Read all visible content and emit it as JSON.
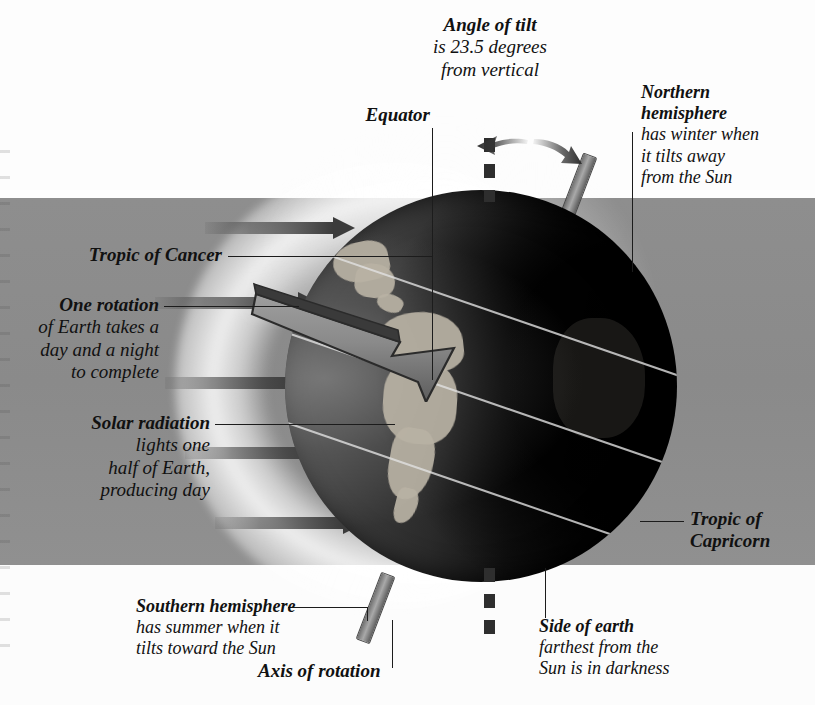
{
  "diagram": {
    "subject": "Earth",
    "tilt_degrees": "23.5"
  },
  "labels": {
    "angle_of_tilt": {
      "head": "Angle of tilt",
      "line2": "is 23.5 degrees",
      "line3": "from vertical"
    },
    "equator": {
      "head": "Equator"
    },
    "northern_hemisphere": {
      "head": "Northern",
      "head2": "hemisphere",
      "line3": "has winter when",
      "line4": "it tilts away",
      "line5": "from the Sun"
    },
    "tropic_of_cancer": {
      "head": "Tropic of Cancer"
    },
    "one_rotation": {
      "head": "One rotation",
      "line2": "of Earth takes a",
      "line3": "day and a night",
      "line4": "to complete"
    },
    "solar_radiation": {
      "head": "Solar radiation",
      "line2": "lights one",
      "line3": "half of Earth,",
      "line4": "producing day"
    },
    "tropic_of_capricorn": {
      "head": "Tropic of",
      "head2": "Capricorn"
    },
    "southern_hemisphere": {
      "head": "Southern hemisphere",
      "line2": "has summer when it",
      "line3": "tilts toward the Sun"
    },
    "axis_of_rotation": {
      "head": "Axis of rotation"
    },
    "side_of_earth": {
      "head": "Side of earth",
      "line2": "farthest from the",
      "line3": "Sun is in darkness"
    }
  },
  "colors": {
    "background_band": "#8e8e8e",
    "page_white": "#ffffff",
    "text": "#111111",
    "arrow_dark": "#3b3b3b",
    "axis_rod": "#a9a9a9",
    "land": "#b9b2a4",
    "latitude_line": "#e1e1e1"
  },
  "graphics": {
    "solar_arrow_count": 5,
    "latitude_line_count": 3,
    "rotation_direction": "west-to-east (arrow points down-right)",
    "lit_side": "left",
    "dark_side": "right"
  }
}
